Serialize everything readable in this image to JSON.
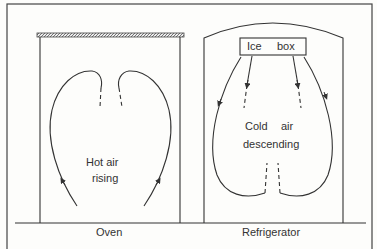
{
  "diagram": {
    "oven": {
      "label": "Oven",
      "annotation_line1": "Hot air",
      "annotation_line2": "rising"
    },
    "refrigerator": {
      "label": "Refrigerator",
      "icebox_label_1": "Ice",
      "icebox_label_2": "box",
      "annotation_line1a": "Cold",
      "annotation_line1b": "air",
      "annotation_line2": "descending"
    },
    "colors": {
      "line": "#333333",
      "background": "#fdfdfb"
    }
  }
}
